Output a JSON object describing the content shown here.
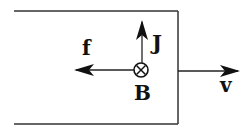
{
  "diagram": {
    "type": "physics-vector-diagram",
    "labels": {
      "force": "f",
      "current_density": "J",
      "magnetic_field": "B",
      "velocity": "v"
    },
    "symbols": {
      "magnetic_field_direction": "into-page (⊗)"
    },
    "colors": {
      "stroke": "#222222",
      "background": "#ffffff"
    }
  }
}
